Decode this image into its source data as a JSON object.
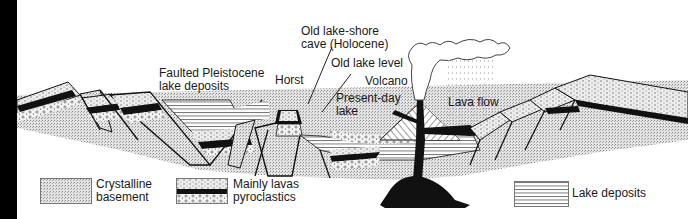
{
  "diagram": {
    "type": "geological-cross-section",
    "labels": {
      "faulted_deposits_line1": "Faulted Pleistocene",
      "faulted_deposits_line2": "lake deposits",
      "horst": "Horst",
      "old_cave_line1": "Old lake-shore",
      "old_cave_line2": "cave (Holocene)",
      "old_lake_level": "Old lake level",
      "volcano": "Volcano",
      "present_lake_line1": "Present-day",
      "present_lake_line2": "lake",
      "lava_flow": "Lava flow"
    },
    "legend": [
      {
        "id": "crystalline",
        "line1": "Crystalline",
        "line2": "basement"
      },
      {
        "id": "lavas",
        "line1": "Mainly lavas",
        "line2": "pyroclastics"
      },
      {
        "id": "lake",
        "line1": "Lake deposits",
        "line2": ""
      }
    ],
    "colors": {
      "ink": "#111111",
      "basement": "#c9c9c9",
      "lava_layer": "#d8d8d8",
      "background": "#ffffff"
    }
  }
}
